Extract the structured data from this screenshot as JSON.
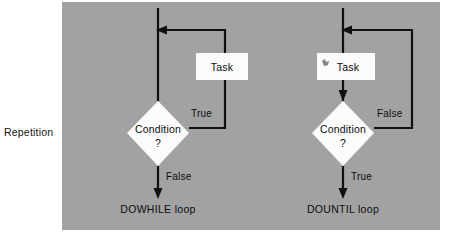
{
  "figure": {
    "side_label": "Repetition",
    "panel_color": "#a2a2a2",
    "ink_color": "#101010",
    "shape_fill": "#fbfbfb"
  },
  "diagrams": [
    {
      "id": "dowhile",
      "caption": "DOWHILE loop",
      "task_label": "Task",
      "condition_label": "Condition",
      "condition_mark": "?",
      "loop_edge_label": "True",
      "exit_edge_label": "False",
      "order": "condition-first"
    },
    {
      "id": "dountil",
      "caption": "DOUNTIL loop",
      "task_label": "Task",
      "condition_label": "Condition",
      "condition_mark": "?",
      "loop_edge_label": "False",
      "exit_edge_label": "True",
      "order": "task-first"
    }
  ]
}
